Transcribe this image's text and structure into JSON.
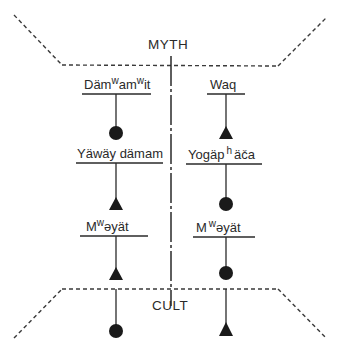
{
  "regions": {
    "top": "MYTH",
    "bottom": "CULT"
  },
  "left_column": {
    "labels": [
      {
        "base": "Däm",
        "sup1": "w",
        "mid": "am",
        "sup2": "w",
        "end": "it"
      },
      {
        "text": "Yäwäy dämam"
      },
      {
        "base": "M",
        "sup": "w",
        "end": "əyät"
      }
    ],
    "symbols": [
      "circle",
      "triangle",
      "triangle",
      "circle"
    ]
  },
  "right_column": {
    "labels": [
      {
        "text": "Waq"
      },
      {
        "base": "Yogäp",
        "sup": "h",
        "end": "äča"
      },
      {
        "base": "M",
        "sup": "w",
        "end": "əyät"
      }
    ],
    "symbols": [
      "triangle",
      "circle",
      "circle",
      "triangle"
    ]
  },
  "colors": {
    "ink": "#2a2a2a",
    "background": "#ffffff"
  }
}
